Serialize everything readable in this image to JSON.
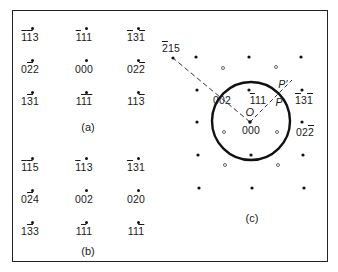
{
  "figure": {
    "panels": {
      "a": {
        "caption": "(a)",
        "spots": [
          {
            "label_parts": [
              {
                "t": "1",
                "bar": true
              },
              {
                "t": "1",
                "bar": true
              },
              {
                "t": "3",
                "bar": false
              }
            ],
            "text": "-1-13"
          },
          {
            "label_parts": [
              {
                "t": "1",
                "bar": true
              },
              {
                "t": "1",
                "bar": false
              },
              {
                "t": "1",
                "bar": false
              }
            ],
            "text": "-111"
          },
          {
            "label_parts": [
              {
                "t": "1",
                "bar": true
              },
              {
                "t": "3",
                "bar": false
              },
              {
                "t": "1",
                "bar": true
              }
            ],
            "text": "-13-1"
          },
          {
            "label_parts": [
              {
                "t": "0",
                "bar": false
              },
              {
                "t": "2",
                "bar": true
              },
              {
                "t": "2",
                "bar": false
              }
            ],
            "text": "0-22"
          },
          {
            "label_parts": [
              {
                "t": "0",
                "bar": false
              },
              {
                "t": "0",
                "bar": false
              },
              {
                "t": "0",
                "bar": false
              }
            ],
            "text": "000"
          },
          {
            "label_parts": [
              {
                "t": "0",
                "bar": false
              },
              {
                "t": "2",
                "bar": false
              },
              {
                "t": "2",
                "bar": true
              }
            ],
            "text": "02-2"
          },
          {
            "label_parts": [
              {
                "t": "1",
                "bar": false
              },
              {
                "t": "3",
                "bar": true
              },
              {
                "t": "1",
                "bar": false
              }
            ],
            "text": "1-31"
          },
          {
            "label_parts": [
              {
                "t": "1",
                "bar": false
              },
              {
                "t": "1",
                "bar": true
              },
              {
                "t": "1",
                "bar": true
              }
            ],
            "text": "1-1-1"
          },
          {
            "label_parts": [
              {
                "t": "1",
                "bar": false
              },
              {
                "t": "1",
                "bar": false
              },
              {
                "t": "3",
                "bar": true
              }
            ],
            "text": "11-3"
          }
        ]
      },
      "b": {
        "caption": "(b)",
        "spots": [
          {
            "label_parts": [
              {
                "t": "1",
                "bar": true
              },
              {
                "t": "1",
                "bar": true
              },
              {
                "t": "5",
                "bar": false
              }
            ],
            "text": "-1-15"
          },
          {
            "label_parts": [
              {
                "t": "1",
                "bar": true
              },
              {
                "t": "1",
                "bar": false
              },
              {
                "t": "3",
                "bar": false
              }
            ],
            "text": "-113"
          },
          {
            "label_parts": [
              {
                "t": "1",
                "bar": true
              },
              {
                "t": "3",
                "bar": false
              },
              {
                "t": "1",
                "bar": false
              }
            ],
            "text": "-131"
          },
          {
            "label_parts": [
              {
                "t": "0",
                "bar": false
              },
              {
                "t": "2",
                "bar": true
              },
              {
                "t": "4",
                "bar": false
              }
            ],
            "text": "0-24"
          },
          {
            "label_parts": [
              {
                "t": "0",
                "bar": false
              },
              {
                "t": "0",
                "bar": false
              },
              {
                "t": "2",
                "bar": false
              }
            ],
            "text": "002"
          },
          {
            "label_parts": [
              {
                "t": "0",
                "bar": false
              },
              {
                "t": "2",
                "bar": false
              },
              {
                "t": "0",
                "bar": false
              }
            ],
            "text": "020"
          },
          {
            "label_parts": [
              {
                "t": "1",
                "bar": false
              },
              {
                "t": "3",
                "bar": true
              },
              {
                "t": "3",
                "bar": false
              }
            ],
            "text": "1-33"
          },
          {
            "label_parts": [
              {
                "t": "1",
                "bar": false
              },
              {
                "t": "1",
                "bar": true
              },
              {
                "t": "1",
                "bar": false
              }
            ],
            "text": "1-11"
          },
          {
            "label_parts": [
              {
                "t": "1",
                "bar": false
              },
              {
                "t": "1",
                "bar": false
              },
              {
                "t": "1",
                "bar": true
              }
            ],
            "text": "11-1"
          }
        ]
      },
      "c": {
        "caption": "(c)",
        "labels": {
          "far_spot": [
            {
              "t": "2",
              "bar": true
            },
            {
              "t": "1",
              "bar": false
            },
            {
              "t": "5",
              "bar": false
            }
          ],
          "in_circle_002": [
            {
              "t": "0",
              "bar": false
            },
            {
              "t": "0",
              "bar": false
            },
            {
              "t": "2",
              "bar": false
            }
          ],
          "in_circle_111": [
            {
              "t": "1",
              "bar": true
            },
            {
              "t": "1",
              "bar": false
            },
            {
              "t": "1",
              "bar": false
            }
          ],
          "origin_letter": "O",
          "origin_index": [
            {
              "t": "0",
              "bar": false
            },
            {
              "t": "0",
              "bar": false
            },
            {
              "t": "0",
              "bar": false
            }
          ],
          "right_131": [
            {
              "t": "1",
              "bar": true
            },
            {
              "t": "3",
              "bar": false
            },
            {
              "t": "1",
              "bar": true
            }
          ],
          "right_022": [
            {
              "t": "0",
              "bar": false
            },
            {
              "t": "2",
              "bar": false
            },
            {
              "t": "2",
              "bar": true
            }
          ],
          "point_P": "P",
          "point_P_prime": "P′"
        }
      }
    }
  }
}
